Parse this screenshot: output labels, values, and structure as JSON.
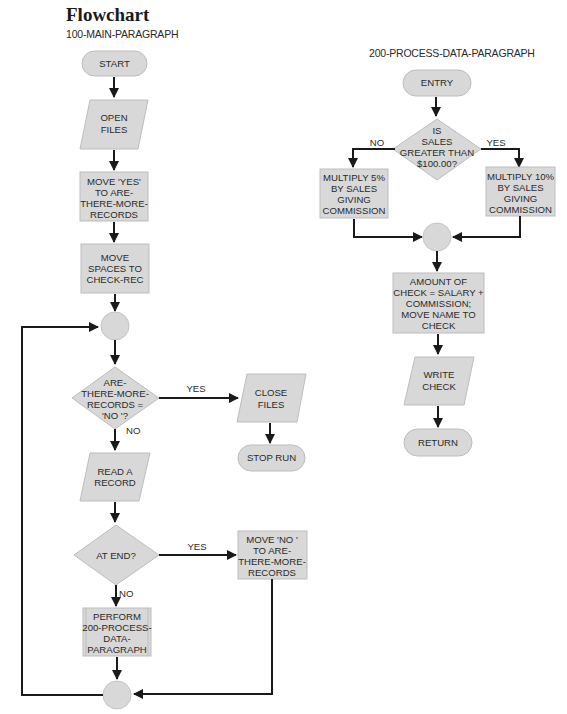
{
  "page": {
    "title": "Flowchart",
    "main_paragraph_label": "100-MAIN-PARAGRAPH",
    "sub_paragraph_label": "200-PROCESS-DATA-PARAGRAPH"
  },
  "colors": {
    "shape_fill": "#d8d8d8",
    "shape_stroke": "#bdbdbd",
    "line": "#1a1a1a",
    "text": "#2a2a2a"
  },
  "main_flow": {
    "start": {
      "type": "terminal",
      "lines": [
        "START"
      ]
    },
    "open_files": {
      "type": "io",
      "lines": [
        "OPEN",
        "FILES"
      ]
    },
    "move_yes": {
      "type": "process",
      "lines": [
        "MOVE 'YES'",
        "TO ARE-",
        "THERE-MORE-",
        "RECORDS"
      ]
    },
    "move_spaces": {
      "type": "process",
      "lines": [
        "MOVE",
        "SPACES TO",
        "CHECK-REC"
      ]
    },
    "connector_top": {
      "type": "connector"
    },
    "decision_more": {
      "type": "decision",
      "lines": [
        "ARE-",
        "THERE-MORE-",
        "RECORDS =",
        "'NO '?"
      ],
      "yes_label": "YES",
      "no_label": "NO"
    },
    "close_files": {
      "type": "io",
      "lines": [
        "CLOSE",
        "FILES"
      ]
    },
    "stop_run": {
      "type": "terminal",
      "lines": [
        "STOP RUN"
      ]
    },
    "read_record": {
      "type": "io",
      "lines": [
        "READ A",
        "RECORD"
      ]
    },
    "decision_end": {
      "type": "decision",
      "lines": [
        "AT END?"
      ],
      "yes_label": "YES",
      "no_label": "NO"
    },
    "move_no": {
      "type": "process",
      "lines": [
        "MOVE 'NO '",
        "TO ARE-",
        "THERE-MORE-",
        "RECORDS"
      ]
    },
    "perform": {
      "type": "predefined",
      "lines": [
        "PERFORM",
        "200-PROCESS-",
        "DATA-",
        "PARAGRAPH"
      ]
    },
    "connector_bottom": {
      "type": "connector"
    }
  },
  "sub_flow": {
    "entry": {
      "type": "terminal",
      "lines": [
        "ENTRY"
      ]
    },
    "decision_sales": {
      "type": "decision",
      "lines": [
        "IS",
        "SALES",
        "GREATER THAN",
        "$100.00?"
      ],
      "yes_label": "YES",
      "no_label": "NO"
    },
    "multiply_5": {
      "type": "process",
      "lines": [
        "MULTIPLY 5%",
        "BY SALES",
        "GIVING",
        "COMMISSION"
      ]
    },
    "multiply_10": {
      "type": "process",
      "lines": [
        "MULTIPLY 10%",
        "BY SALES",
        "GIVING",
        "COMMISSION"
      ]
    },
    "connector": {
      "type": "connector"
    },
    "amount_check": {
      "type": "process",
      "lines": [
        "AMOUNT OF",
        "CHECK = SALARY +",
        "COMMISSION;",
        "MOVE NAME TO",
        "CHECK"
      ]
    },
    "write_check": {
      "type": "io",
      "lines": [
        "WRITE",
        "CHECK"
      ]
    },
    "return": {
      "type": "terminal",
      "lines": [
        "RETURN"
      ]
    }
  }
}
